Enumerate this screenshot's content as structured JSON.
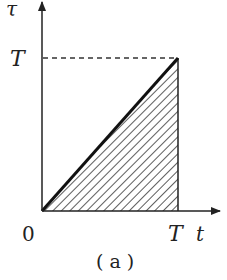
{
  "diagram": {
    "caption": "( a )",
    "y_axis_label": "τ",
    "x_axis_label": "t",
    "origin_label": "0",
    "x_tick_label": "T",
    "y_tick_label": "T",
    "colors": {
      "line": "#222222",
      "hatch": "#333333",
      "dashed": "#333333"
    }
  }
}
